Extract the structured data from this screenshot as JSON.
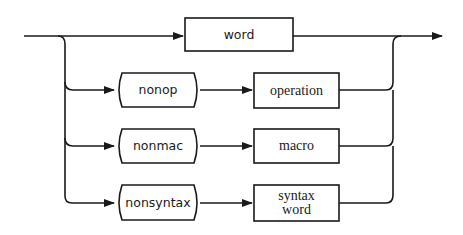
{
  "diagram": {
    "type": "syntax-diagram",
    "main_path": {
      "box": {
        "label": "word"
      }
    },
    "alternatives": [
      {
        "first": "nonop",
        "second": "operation"
      },
      {
        "first": "nonmac",
        "second": "macro"
      },
      {
        "first": "nonsyntax",
        "second_line1": "syntax",
        "second_line2": "word"
      }
    ],
    "colors": {
      "stroke": "#1a1a1a",
      "background": "#ffffff"
    }
  }
}
